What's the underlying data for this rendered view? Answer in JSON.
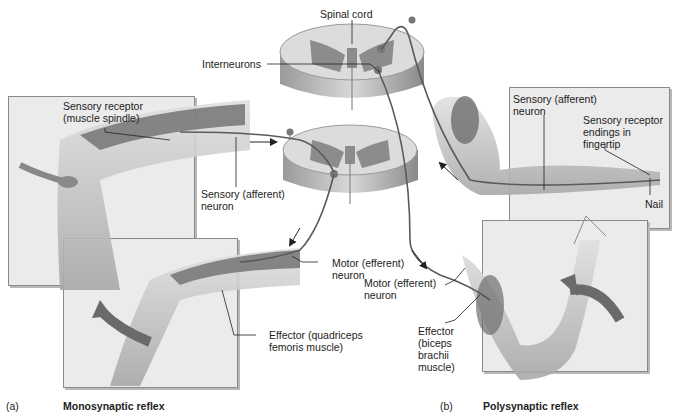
{
  "spinal_cord": {
    "label": "Spinal cord"
  },
  "interneurons": {
    "label": "Interneurons"
  },
  "monosynaptic": {
    "sensory_receptor": "Sensory receptor\n(muscle spindle)",
    "sensory_neuron": "Sensory (afferent)\nneuron",
    "motor_neuron": "Motor (efferent)\nneuron",
    "effector": "Effector (quadriceps\nfemoris muscle)",
    "panel_letter": "(a)",
    "caption": "Monosynaptic reflex"
  },
  "polysynaptic": {
    "sensory_neuron": "Sensory (afferent)\nneuron",
    "sensory_receptor": "Sensory receptor\nendings in\nfingertip",
    "nail": "Nail",
    "motor_neuron": "Motor (efferent)\nneuron",
    "effector": "Effector\n(biceps\nbrachii\nmuscle)",
    "panel_letter": "(b)",
    "caption": "Polysynaptic reflex"
  },
  "colors": {
    "panel_bg": "#ebebeb",
    "gray_matter": "#8c8c8c",
    "white_matter": "#d4d4d4",
    "skin": "#c8c8c8",
    "muscle": "#6e6e6e",
    "arrow": "#6a6a6a",
    "neuron_line": "#5a5a5a"
  }
}
